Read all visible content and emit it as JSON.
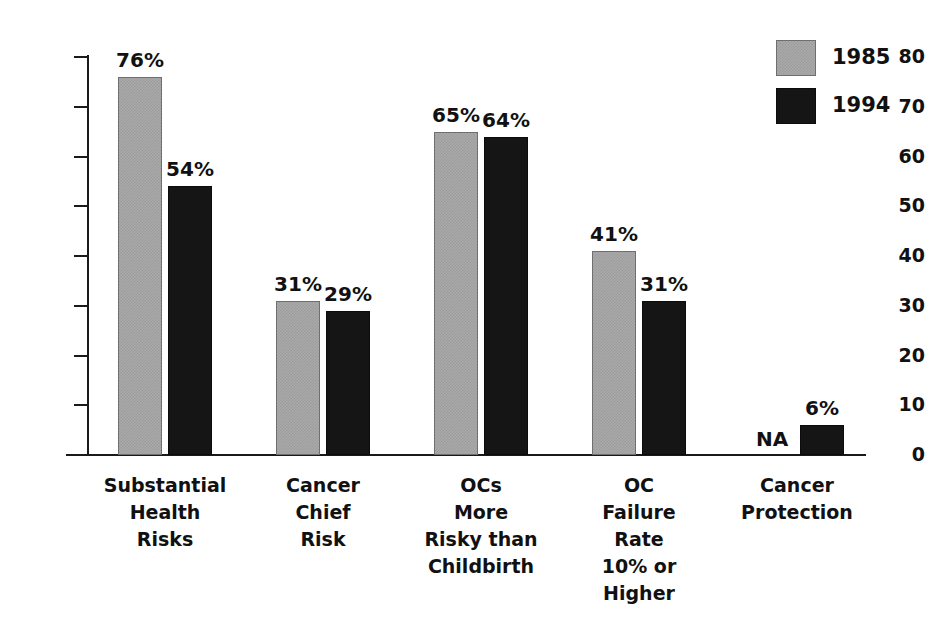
{
  "chart_data": {
    "type": "bar",
    "title": "",
    "subtitle": "",
    "xlabel": "",
    "ylabel": "",
    "ylim": [
      0,
      80
    ],
    "ytick_labels": [
      "80",
      "70",
      "60",
      "50",
      "40",
      "30",
      "20",
      "10",
      "0"
    ],
    "ytick_values": [
      80,
      70,
      60,
      50,
      40,
      30,
      20,
      10,
      0
    ],
    "grid": false,
    "legend_position": "top-right",
    "categories": [
      "Substantial Health Risks",
      "Cancer Chief Risk",
      "OCs More Risky than Childbirth",
      "OC Failure Rate 10% or Higher",
      "Cancer Protection"
    ],
    "category_lines": [
      [
        "Substantial",
        "Health",
        "Risks"
      ],
      [
        "Cancer",
        "Chief",
        "Risk"
      ],
      [
        "OCs",
        "More",
        "Risky than",
        "Childbirth"
      ],
      [
        "OC",
        "Failure",
        "Rate",
        "10% or",
        "Higher"
      ],
      [
        "Cancer",
        "Protection"
      ]
    ],
    "series": [
      {
        "name": "1985",
        "color": "#a9a9a9",
        "values": [
          76,
          31,
          65,
          41,
          null
        ],
        "value_labels": [
          "76%",
          "31%",
          "65%",
          "41%",
          "NA"
        ]
      },
      {
        "name": "1994",
        "color": "#151515",
        "values": [
          54,
          29,
          64,
          31,
          6
        ],
        "value_labels": [
          "54%",
          "29%",
          "64%",
          "31%",
          "6%"
        ]
      }
    ]
  },
  "legend": {
    "items": [
      {
        "label": "1985",
        "color": "#a9a9a9"
      },
      {
        "label": "1994",
        "color": "#151515"
      }
    ]
  }
}
